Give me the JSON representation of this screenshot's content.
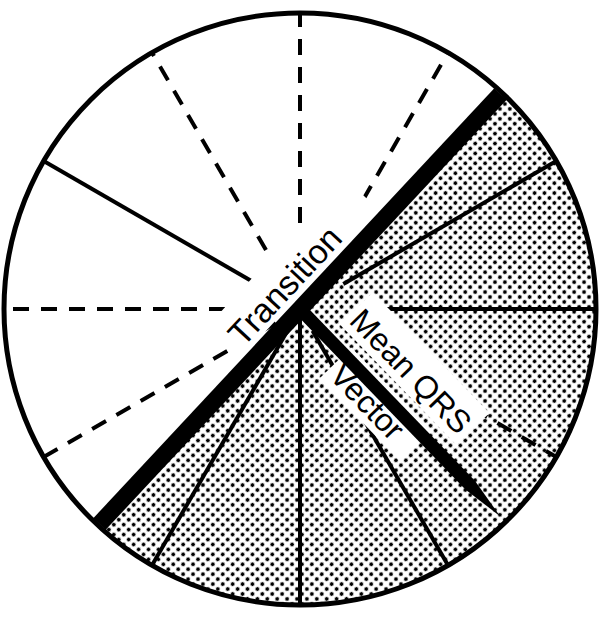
{
  "diagram": {
    "title": "",
    "center": {
      "x": 300,
      "y": 309
    },
    "radius": 296,
    "colors": {
      "ink": "#000000",
      "paper": "#ffffff",
      "stipple": "#000000"
    },
    "shaded_region": {
      "start_angle_deg": 47,
      "end_angle_deg": -133,
      "description": "stippled half from Transition line clockwise to opposite end"
    },
    "spokes": [
      {
        "angle": 90,
        "style": "dashed",
        "inner": 30
      },
      {
        "angle": 120,
        "style": "dashed",
        "inner": 40
      },
      {
        "angle": 150,
        "style": "solid",
        "inner": 55
      },
      {
        "angle": 180,
        "style": "dashed",
        "inner": 75
      },
      {
        "angle": 210,
        "style": "dashed",
        "inner": 0
      },
      {
        "angle": 240,
        "style": "solid",
        "inner": 0
      },
      {
        "angle": 270,
        "style": "solid",
        "inner": 0
      },
      {
        "angle": 300,
        "style": "solid",
        "inner": 25
      },
      {
        "angle": 330,
        "style": "dashed",
        "inner": 200
      },
      {
        "angle": 0,
        "style": "solid",
        "inner": 70
      },
      {
        "angle": 30,
        "style": "solid",
        "inner": 50
      },
      {
        "angle": 60,
        "style": "dashed",
        "inner": 70
      }
    ],
    "transition_line": {
      "angle": 47,
      "width": 17
    },
    "mean_qrs_vector": {
      "angle": -46,
      "length": 288,
      "width": 13
    },
    "labels": {
      "transition": "Transition",
      "mean_qrs": "Mean QRS",
      "vector": "Vector"
    }
  }
}
